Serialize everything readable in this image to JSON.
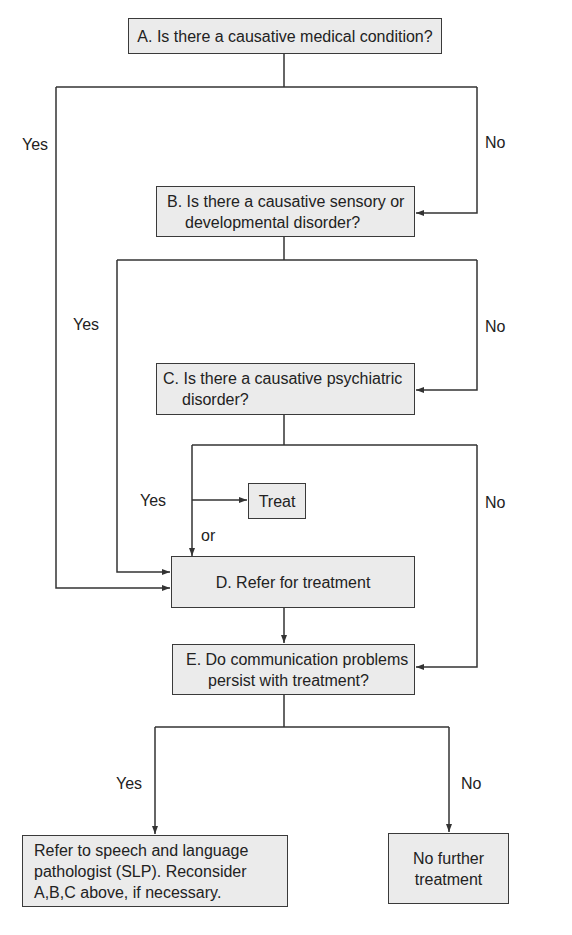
{
  "diagram": {
    "type": "flowchart",
    "nodes": {
      "A": {
        "text": "A. Is there a causative medical condition?"
      },
      "B": {
        "line1": "B. Is there a causative sensory or",
        "line2": "developmental disorder?"
      },
      "C": {
        "line1": "C. Is there a causative psychiatric",
        "line2": "disorder?"
      },
      "treat": {
        "text": "Treat"
      },
      "D": {
        "text": "D. Refer for treatment"
      },
      "E": {
        "line1": "E. Do communication problems",
        "line2": "persist with treatment?"
      },
      "slp": {
        "line1": "Refer to speech and language",
        "line2": "pathologist (SLP). Reconsider",
        "line3": "A,B,C above, if necessary."
      },
      "nofurther": {
        "line1": "No further",
        "line2": "treatment"
      }
    },
    "labels": {
      "a_yes": "Yes",
      "a_no": "No",
      "b_yes": "Yes",
      "b_no": "No",
      "c_yes": "Yes",
      "c_no": "No",
      "c_or": "or",
      "e_yes": "Yes",
      "e_no": "No"
    },
    "edges": [
      {
        "from": "A",
        "to": "D",
        "label": "Yes"
      },
      {
        "from": "A",
        "to": "B",
        "label": "No"
      },
      {
        "from": "B",
        "to": "D",
        "label": "Yes"
      },
      {
        "from": "B",
        "to": "C",
        "label": "No"
      },
      {
        "from": "C",
        "to": "Treat",
        "label": "Yes"
      },
      {
        "from": "C",
        "to": "D",
        "label": "or"
      },
      {
        "from": "C",
        "to": "E",
        "label": "No"
      },
      {
        "from": "D",
        "to": "E",
        "label": ""
      },
      {
        "from": "E",
        "to": "SLP",
        "label": "Yes"
      },
      {
        "from": "E",
        "to": "No further treatment",
        "label": "No"
      }
    ]
  }
}
